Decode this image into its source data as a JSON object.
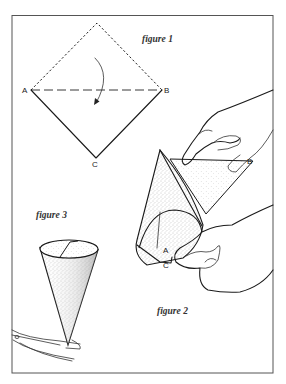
{
  "figure1": {
    "caption": "figure 1",
    "labels": {
      "a": "A",
      "b": "B",
      "c": "C"
    },
    "description": "Square sheet turned diagonally; top half dashed, fold line A–B dashed, curved arrow shows folding top down"
  },
  "figure2": {
    "caption": "figure 2",
    "labels": {
      "a": "A",
      "b": "B",
      "c": "C"
    },
    "description": "Hands rolling the folded triangle into a cone, corners A and C meeting at the bottom"
  },
  "figure3": {
    "caption": "figure 3",
    "description": "Finished paper cone with scissors snipping the tip"
  },
  "colors": {
    "ink": "#1a1a1a",
    "stipple": "#9a9a9a",
    "frame": "#555555",
    "background": "#ffffff"
  }
}
